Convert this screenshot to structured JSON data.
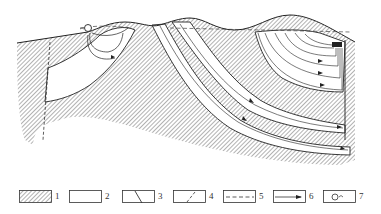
{
  "diagram": {
    "type": "geological cross-section",
    "colors": {
      "line": "#222222",
      "hatch": "#555555",
      "background": "#ffffff"
    },
    "features": {
      "spring": "spring-icon at left hilltop",
      "fault": "dashed vertical fault at left",
      "discharge_zone": "spring discharge at right upper margin",
      "water_table": "dashed line below ground surface"
    }
  },
  "legend": {
    "items": [
      {
        "num": "1",
        "symbol": "hatched-box",
        "meaning": "aquitard"
      },
      {
        "num": "2",
        "symbol": "blank-box",
        "meaning": "aquifer"
      },
      {
        "num": "3",
        "symbol": "solid-diagonal-line",
        "meaning": "boundary"
      },
      {
        "num": "4",
        "symbol": "dashed-diagonal-line",
        "meaning": "fault"
      },
      {
        "num": "5",
        "symbol": "dashed-horizontal-line",
        "meaning": "water table"
      },
      {
        "num": "6",
        "symbol": "arrow-line",
        "meaning": "flow direction"
      },
      {
        "num": "7",
        "symbol": "spring-circle",
        "meaning": "spring"
      }
    ]
  }
}
